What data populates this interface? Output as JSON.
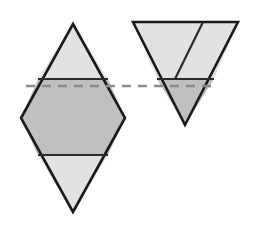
{
  "figure": {
    "canvas": {
      "width": 253,
      "height": 233,
      "background": "#ffffff"
    },
    "colors": {
      "outline": "#1a1a1a",
      "fill_light": "#e2e2e2",
      "fill_medium": "#c0c0c0",
      "dashed_line": "#8c8c8c",
      "interior_line": "#2b2b2b",
      "background": "#ffffff"
    },
    "stroke": {
      "outline_width": 2.6,
      "interior_width": 2.2,
      "dashed_width": 2.6,
      "dash_pattern": "9 7"
    },
    "reference_line": {
      "name": "dashed-reference-line",
      "y": 86,
      "x_start": 26,
      "x_end": 217,
      "style": "dashed",
      "color": "#8c8c8c"
    },
    "left_shape": {
      "name": "left-composite-rhombus",
      "apex_top": {
        "x": 73,
        "y": 24
      },
      "apex_bottom": {
        "x": 73,
        "y": 212
      },
      "vertex_left": {
        "x": 21,
        "y": 118
      },
      "vertex_right": {
        "x": 125,
        "y": 118
      },
      "upper_cut_y": 79,
      "lower_cut_y": 155,
      "upper_cut_x_left": 38,
      "upper_cut_x_right": 108,
      "lower_cut_x_left": 38,
      "lower_cut_x_right": 108,
      "regions": [
        {
          "name": "left-top-triangle",
          "fill": "#e2e2e2"
        },
        {
          "name": "left-middle-hexagon-band",
          "fill": "#c0c0c0"
        },
        {
          "name": "left-bottom-triangle",
          "fill": "#e2e2e2"
        }
      ]
    },
    "right_shape": {
      "name": "right-inverted-triangle",
      "corner_top_left": {
        "x": 133,
        "y": 22
      },
      "corner_top_right": {
        "x": 238,
        "y": 22
      },
      "apex_bottom": {
        "x": 185,
        "y": 125
      },
      "cut_y": 79,
      "cut_x_left": 157,
      "cut_x_right": 214,
      "oblique_top": {
        "x": 203,
        "y": 22
      },
      "oblique_bottom": {
        "x": 175,
        "y": 79
      },
      "regions": [
        {
          "name": "right-upper-left-region",
          "fill": "#e2e2e2"
        },
        {
          "name": "right-upper-right-region",
          "fill": "#e2e2e2"
        },
        {
          "name": "right-lower-triangle",
          "fill": "#c0c0c0"
        }
      ]
    }
  }
}
